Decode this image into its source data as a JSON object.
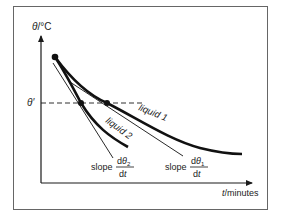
{
  "diagram": {
    "y_axis_label": "θ/°C",
    "x_axis_label": "t/minutes",
    "theta_prime_label": "θ′",
    "curves": [
      {
        "name": "liquid 1",
        "label": "liquid 1"
      },
      {
        "name": "liquid 2",
        "label": "liquid 2"
      }
    ],
    "slope_labels": [
      {
        "prefix": "slope",
        "numerator": "dθ₂",
        "denominator": "dt",
        "curve": "liquid 2"
      },
      {
        "prefix": "slope",
        "numerator": "dθ₁",
        "denominator": "dt",
        "curve": "liquid 1"
      }
    ],
    "colors": {
      "ink": "#1a1a1a",
      "frame": "#555555",
      "background": "#ffffff"
    }
  }
}
